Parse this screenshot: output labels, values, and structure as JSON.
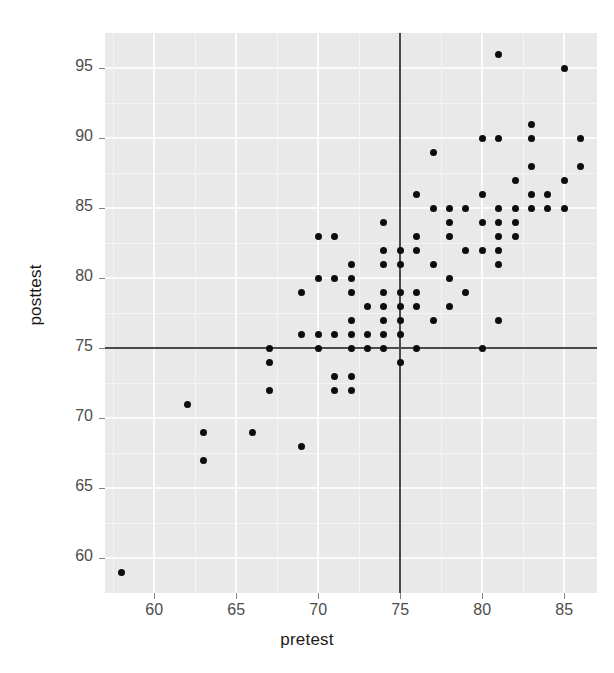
{
  "chart_data": {
    "type": "scatter",
    "title": "",
    "xlabel": "pretest",
    "ylabel": "posttest",
    "xlim": [
      57,
      87
    ],
    "ylim": [
      57.5,
      97.5
    ],
    "xticks": [
      60,
      65,
      70,
      75,
      80,
      85
    ],
    "yticks": [
      60,
      65,
      70,
      75,
      80,
      85,
      90,
      95
    ],
    "grid": true,
    "legend": null,
    "reference_lines": [
      {
        "orientation": "vertical",
        "value": 75,
        "color": "#4a4a4a"
      },
      {
        "orientation": "horizontal",
        "value": 75,
        "color": "#4a4a4a"
      }
    ],
    "marker": {
      "shape": "circle",
      "color": "#0d0d0d",
      "size": 7
    },
    "panel_background": "#e9e9e9",
    "points": [
      {
        "x": 58,
        "y": 59
      },
      {
        "x": 62,
        "y": 71
      },
      {
        "x": 63,
        "y": 69
      },
      {
        "x": 63,
        "y": 67
      },
      {
        "x": 66,
        "y": 69
      },
      {
        "x": 67,
        "y": 75
      },
      {
        "x": 67,
        "y": 74
      },
      {
        "x": 67,
        "y": 72
      },
      {
        "x": 69,
        "y": 68
      },
      {
        "x": 69,
        "y": 76
      },
      {
        "x": 69,
        "y": 79
      },
      {
        "x": 70,
        "y": 75
      },
      {
        "x": 70,
        "y": 76
      },
      {
        "x": 70,
        "y": 80
      },
      {
        "x": 70,
        "y": 83
      },
      {
        "x": 71,
        "y": 72
      },
      {
        "x": 71,
        "y": 73
      },
      {
        "x": 71,
        "y": 76
      },
      {
        "x": 71,
        "y": 80
      },
      {
        "x": 71,
        "y": 83
      },
      {
        "x": 72,
        "y": 72
      },
      {
        "x": 72,
        "y": 73
      },
      {
        "x": 72,
        "y": 75
      },
      {
        "x": 72,
        "y": 76
      },
      {
        "x": 72,
        "y": 77
      },
      {
        "x": 72,
        "y": 79
      },
      {
        "x": 72,
        "y": 80
      },
      {
        "x": 72,
        "y": 81
      },
      {
        "x": 73,
        "y": 75
      },
      {
        "x": 73,
        "y": 76
      },
      {
        "x": 73,
        "y": 78
      },
      {
        "x": 74,
        "y": 75
      },
      {
        "x": 74,
        "y": 76
      },
      {
        "x": 74,
        "y": 77
      },
      {
        "x": 74,
        "y": 78
      },
      {
        "x": 74,
        "y": 79
      },
      {
        "x": 74,
        "y": 81
      },
      {
        "x": 74,
        "y": 82
      },
      {
        "x": 74,
        "y": 84
      },
      {
        "x": 75,
        "y": 74
      },
      {
        "x": 75,
        "y": 76
      },
      {
        "x": 75,
        "y": 77
      },
      {
        "x": 75,
        "y": 78
      },
      {
        "x": 75,
        "y": 79
      },
      {
        "x": 75,
        "y": 81
      },
      {
        "x": 75,
        "y": 82
      },
      {
        "x": 76,
        "y": 75
      },
      {
        "x": 76,
        "y": 78
      },
      {
        "x": 76,
        "y": 79
      },
      {
        "x": 76,
        "y": 82
      },
      {
        "x": 76,
        "y": 83
      },
      {
        "x": 76,
        "y": 86
      },
      {
        "x": 77,
        "y": 77
      },
      {
        "x": 77,
        "y": 81
      },
      {
        "x": 77,
        "y": 85
      },
      {
        "x": 77,
        "y": 89
      },
      {
        "x": 78,
        "y": 78
      },
      {
        "x": 78,
        "y": 80
      },
      {
        "x": 78,
        "y": 83
      },
      {
        "x": 78,
        "y": 84
      },
      {
        "x": 78,
        "y": 85
      },
      {
        "x": 79,
        "y": 79
      },
      {
        "x": 79,
        "y": 82
      },
      {
        "x": 79,
        "y": 85
      },
      {
        "x": 80,
        "y": 75
      },
      {
        "x": 80,
        "y": 82
      },
      {
        "x": 80,
        "y": 84
      },
      {
        "x": 80,
        "y": 86
      },
      {
        "x": 80,
        "y": 90
      },
      {
        "x": 81,
        "y": 77
      },
      {
        "x": 81,
        "y": 81
      },
      {
        "x": 81,
        "y": 82
      },
      {
        "x": 81,
        "y": 83
      },
      {
        "x": 81,
        "y": 84
      },
      {
        "x": 81,
        "y": 85
      },
      {
        "x": 81,
        "y": 90
      },
      {
        "x": 81,
        "y": 96
      },
      {
        "x": 82,
        "y": 83
      },
      {
        "x": 82,
        "y": 84
      },
      {
        "x": 82,
        "y": 85
      },
      {
        "x": 82,
        "y": 87
      },
      {
        "x": 83,
        "y": 85
      },
      {
        "x": 83,
        "y": 86
      },
      {
        "x": 83,
        "y": 88
      },
      {
        "x": 83,
        "y": 90
      },
      {
        "x": 83,
        "y": 91
      },
      {
        "x": 84,
        "y": 85
      },
      {
        "x": 84,
        "y": 86
      },
      {
        "x": 85,
        "y": 85
      },
      {
        "x": 85,
        "y": 87
      },
      {
        "x": 85,
        "y": 95
      },
      {
        "x": 86,
        "y": 88
      },
      {
        "x": 86,
        "y": 90
      }
    ]
  },
  "axes": {
    "x_title": "pretest",
    "y_title": "posttest",
    "x_tick_labels": [
      "60",
      "65",
      "70",
      "75",
      "80",
      "85"
    ],
    "y_tick_labels": [
      "95",
      "90",
      "85",
      "80",
      "75",
      "70",
      "65",
      "60"
    ]
  }
}
